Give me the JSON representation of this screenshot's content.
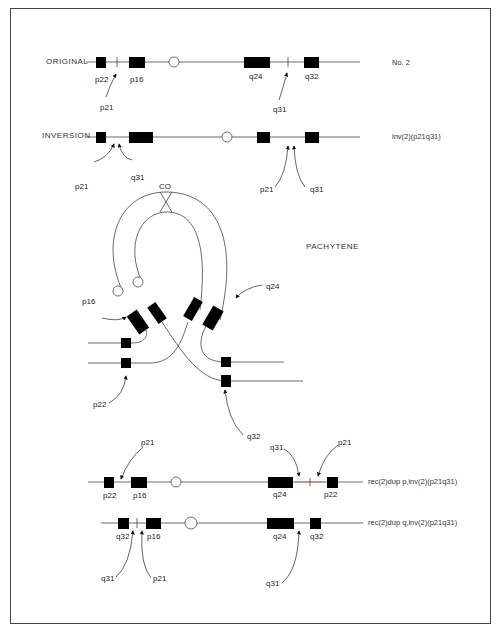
{
  "figure": {
    "rows": {
      "original": {
        "title": "ORIGINAL",
        "side": "No. 2",
        "bands": {
          "p22": "p22",
          "p16": "p16",
          "p21": "p21",
          "q24": "q24",
          "q32": "q32",
          "q31": "q31"
        }
      },
      "inversion": {
        "title": "INVERSION",
        "side": "inv(2)(p21q31)",
        "labels": {
          "p21a": "p21",
          "q31a": "q31",
          "p21b": "p21",
          "q31b": "q31"
        }
      },
      "pachytene": {
        "title": "PACHYTENE",
        "co": "CO",
        "labels": {
          "p16": "p16",
          "q24": "q24",
          "p22": "p22",
          "q32": "q32"
        }
      },
      "rec_dup_p": {
        "side": "rec(2)dup p,inv(2)(p21q31)",
        "labels": {
          "p21a": "p21",
          "p22a": "p22",
          "p16": "p16",
          "q31": "q31",
          "p21b": "p21",
          "q24": "q24",
          "p22b": "p22"
        }
      },
      "rec_dup_q": {
        "side": "rec(2)dup q,inv(2)(p21q31)",
        "labels": {
          "q32a": "q32",
          "p16": "p16",
          "q31a": "q31",
          "p21": "p21",
          "q24": "q24",
          "q32b": "q32",
          "q31b": "q31"
        }
      }
    }
  }
}
